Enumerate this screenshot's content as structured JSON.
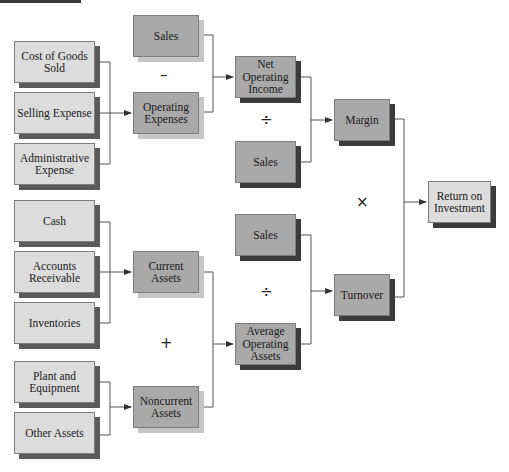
{
  "caption_clipped": "(ROI)",
  "colors": {
    "light_box": "#dcdcdc",
    "dark_box": "#a9a9a9",
    "shadow_dark": "#3b3b3b",
    "shadow_light": "#c6c6c6",
    "line": "#555555"
  },
  "boxes": {
    "cogs": "Cost of Goods Sold",
    "selling": "Selling Expense",
    "admin": "Administrative Expense",
    "cash": "Cash",
    "ar": "Accounts Receivable",
    "inventories": "Inventories",
    "plant": "Plant and Equipment",
    "other_assets": "Other Assets",
    "sales_top": "Sales",
    "operating_expenses": "Operating Expenses",
    "current_assets": "Current Assets",
    "noncurrent_assets": "Noncurrent Assets",
    "noi": "Net Operating Income",
    "sales_margin": "Sales",
    "sales_turnover": "Sales",
    "avg_operating_assets": "Average Operating Assets",
    "margin": "Margin",
    "turnover": "Turnover",
    "roi": "Return on Investment"
  },
  "operators": {
    "minus": "–",
    "divide_margin": "÷",
    "plus": "+",
    "divide_turnover": "÷",
    "times": "×"
  }
}
